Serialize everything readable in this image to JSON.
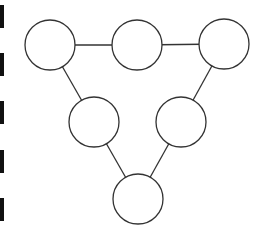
{
  "diagram": {
    "type": "graph",
    "stroke_color": "#333333",
    "fill_color": "#ffffff",
    "bar_color": "#111111",
    "node_radius": 25,
    "nodes": [
      {
        "id": "top-left",
        "x": 50,
        "y": 45,
        "label": ""
      },
      {
        "id": "top-middle",
        "x": 137,
        "y": 45,
        "label": ""
      },
      {
        "id": "top-right",
        "x": 224,
        "y": 44,
        "label": ""
      },
      {
        "id": "middle-left",
        "x": 94,
        "y": 122,
        "label": ""
      },
      {
        "id": "middle-right",
        "x": 181,
        "y": 122,
        "label": ""
      },
      {
        "id": "bottom",
        "x": 138,
        "y": 199,
        "label": ""
      }
    ],
    "edges": [
      {
        "from": "top-left",
        "to": "top-middle"
      },
      {
        "from": "top-middle",
        "to": "top-right"
      },
      {
        "from": "top-left",
        "to": "middle-left"
      },
      {
        "from": "top-right",
        "to": "middle-right"
      },
      {
        "from": "middle-left",
        "to": "bottom"
      },
      {
        "from": "middle-right",
        "to": "bottom"
      }
    ],
    "left_bars": [
      {
        "y": 5,
        "height": 23
      },
      {
        "y": 53,
        "height": 23
      },
      {
        "y": 101,
        "height": 23
      },
      {
        "y": 150,
        "height": 23
      },
      {
        "y": 198,
        "height": 23
      }
    ]
  }
}
